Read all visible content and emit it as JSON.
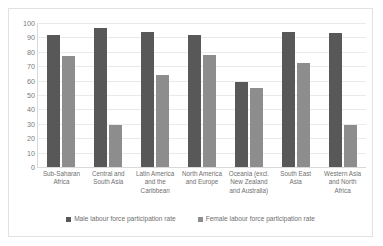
{
  "chart_data": {
    "type": "bar",
    "title": "",
    "xlabel": "",
    "ylabel": "",
    "ylim": [
      0,
      100
    ],
    "yticks": [
      "100",
      "90",
      "80",
      "70",
      "60",
      "50",
      "40",
      "30",
      "20",
      "10",
      "0"
    ],
    "grid": true,
    "legend_position": "bottom",
    "categories": [
      "Sub-Saharan Africa",
      "Central and South Asia",
      "Latin America and the Caribbean",
      "North America and Europe",
      "Oceania (excl. New Zealand and Australia)",
      "South East Asia",
      "Western Asia and North Africa"
    ],
    "category_lines": [
      [
        "Sub-Saharan",
        "Africa"
      ],
      [
        "Central and",
        "South Asia"
      ],
      [
        "Latin America",
        "and the",
        "Caribbean"
      ],
      [
        "North America",
        "and Europe"
      ],
      [
        "Oceania (excl.",
        "New Zealand",
        "and Australia)"
      ],
      [
        "South East",
        "Asia"
      ],
      [
        "Western Asia",
        "and North",
        "Africa"
      ]
    ],
    "series": [
      {
        "name": "Male labour force participation rate",
        "color": "#585858",
        "values": [
          92,
          96.5,
          94,
          92,
          59,
          94,
          93
        ]
      },
      {
        "name": "Female labour force participation rate",
        "color": "#8d8d8d",
        "values": [
          77,
          29,
          64,
          77.5,
          55,
          72,
          29
        ]
      }
    ]
  },
  "legend": {
    "items": [
      {
        "label": "Male labour force participation rate",
        "key": "male"
      },
      {
        "label": "Female labour force participation rate",
        "key": "female"
      }
    ]
  },
  "colors": {
    "male_bar": "#585858",
    "female_bar": "#8d8d8d",
    "gridline": "#eaeaea",
    "axis": "#d9d9d9",
    "text": "#6f6f6f",
    "frame_border": "#e2e2e2",
    "background": "#ffffff"
  }
}
